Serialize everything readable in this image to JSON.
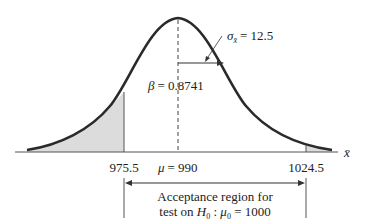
{
  "diagram": {
    "type": "normal-distribution-acceptance-region",
    "sigma_label": "σ",
    "sigma_sub": "x̄",
    "sigma_value": "= 12.5",
    "beta_label": "β",
    "beta_value": "= 0.8741",
    "axis_variable": "x̄",
    "tick_left": "975.5",
    "tick_mu_symbol": "μ",
    "tick_mu_value": "= 990",
    "tick_right": "1024.5",
    "region_line1": "Acceptance region for",
    "region_line2_prefix": "test on ",
    "region_H": "H",
    "region_H_sub": "0",
    "region_colon": " : ",
    "region_mu": "μ",
    "region_mu_sub": "0",
    "region_value": " = 1000",
    "colors": {
      "curve": "#2a2a2a",
      "shade": "#dcdcdc",
      "axis": "#555555",
      "text": "#222222"
    }
  }
}
